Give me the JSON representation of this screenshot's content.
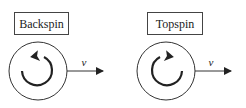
{
  "diagram": {
    "panels": [
      {
        "label": "Backspin",
        "spin_direction": "counterclockwise",
        "velocity_label": "v",
        "velocity_direction": "right"
      },
      {
        "label": "Topspin",
        "spin_direction": "clockwise",
        "velocity_label": "v",
        "velocity_direction": "right"
      }
    ],
    "colors": {
      "stroke": "#222222",
      "background": "#ffffff"
    }
  }
}
